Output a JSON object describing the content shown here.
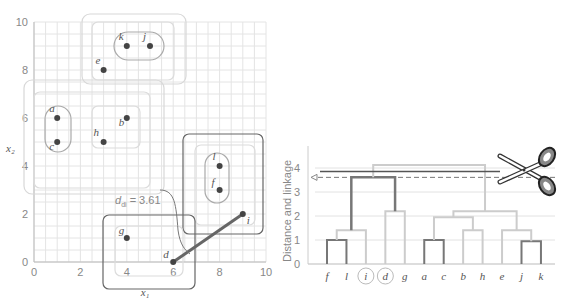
{
  "scatter": {
    "xlabel": "x1",
    "ylabel": "x2",
    "x_ticks": [
      "0",
      "2",
      "4",
      "6",
      "8",
      "10"
    ],
    "y_ticks": [
      "0",
      "2",
      "4",
      "6",
      "8",
      "10"
    ],
    "annotation": "d_di = 3.61",
    "points": [
      {
        "name": "a",
        "x": 1,
        "y": 6
      },
      {
        "name": "b",
        "x": 4,
        "y": 6
      },
      {
        "name": "c",
        "x": 1,
        "y": 5
      },
      {
        "name": "d",
        "x": 6,
        "y": 0
      },
      {
        "name": "e",
        "x": 3,
        "y": 8
      },
      {
        "name": "f",
        "x": 8,
        "y": 3
      },
      {
        "name": "g",
        "x": 4,
        "y": 1
      },
      {
        "name": "h",
        "x": 3,
        "y": 5
      },
      {
        "name": "i",
        "x": 9,
        "y": 2
      },
      {
        "name": "j",
        "x": 5,
        "y": 9
      },
      {
        "name": "k",
        "x": 4,
        "y": 9
      },
      {
        "name": "l",
        "x": 8,
        "y": 4
      }
    ]
  },
  "dendrogram": {
    "ylabel": "Distance and linkage",
    "y_ticks": [
      "0",
      "1",
      "2",
      "3",
      "4"
    ],
    "leaves": [
      "f",
      "l",
      "i",
      "d",
      "g",
      "a",
      "c",
      "b",
      "h",
      "e",
      "j",
      "k"
    ],
    "highlighted_leaves": [
      "i",
      "d"
    ],
    "cut_height": 3.61,
    "icon": "scissors-icon"
  },
  "chart_data": {
    "type": "scatter",
    "title": "",
    "xlabel": "x1",
    "ylabel": "x2",
    "xlim": [
      0,
      10
    ],
    "ylim": [
      0,
      10
    ],
    "points": {
      "a": [
        1,
        6
      ],
      "b": [
        4,
        6
      ],
      "c": [
        1,
        5
      ],
      "d": [
        6,
        0
      ],
      "e": [
        3,
        8
      ],
      "f": [
        8,
        3
      ],
      "g": [
        4,
        1
      ],
      "h": [
        3,
        5
      ],
      "i": [
        9,
        2
      ],
      "j": [
        5,
        9
      ],
      "k": [
        4,
        9
      ],
      "l": [
        8,
        4
      ]
    },
    "annotation": "d_di = 3.61",
    "dendrogram": {
      "ylabel": "Distance and linkage",
      "ylim": [
        0,
        4.5
      ],
      "leaf_order": [
        "f",
        "l",
        "i",
        "d",
        "g",
        "a",
        "c",
        "b",
        "h",
        "e",
        "j",
        "k"
      ],
      "merges": [
        {
          "left": "f",
          "right": "l",
          "height": 1.0
        },
        {
          "left": "fl",
          "right": "i",
          "height": 1.41
        },
        {
          "left": "d",
          "right": "g",
          "height": 2.24
        },
        {
          "left": "fli",
          "right": "dg",
          "height": 3.61
        },
        {
          "left": "a",
          "right": "c",
          "height": 1.0
        },
        {
          "left": "b",
          "right": "h",
          "height": 1.41
        },
        {
          "left": "ac",
          "right": "bh",
          "height": 2.0
        },
        {
          "left": "j",
          "right": "k",
          "height": 1.0
        },
        {
          "left": "e",
          "right": "jk",
          "height": 1.41
        },
        {
          "left": "acbh",
          "right": "ejk",
          "height": 2.24
        },
        {
          "left": "flidg",
          "right": "acbhejk",
          "height": 4.12
        }
      ],
      "cut_line": 3.61
    }
  }
}
